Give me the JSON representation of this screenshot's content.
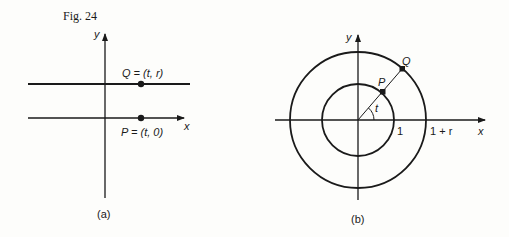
{
  "figure_label": "Fig. 24",
  "panel_a": {
    "caption": "(a)",
    "y_axis_label": "y",
    "x_axis_label": "x",
    "point_q_label": "Q = (t, r)",
    "point_p_label": "P = (t, 0)"
  },
  "panel_b": {
    "caption": "(b)",
    "y_axis_label": "y",
    "x_axis_label": "x",
    "point_q_label": "Q",
    "point_p_label": "P",
    "angle_label": "t",
    "inner_radius_label": "1",
    "outer_radius_label": "1 + r"
  },
  "colors": {
    "ink": "#1a1a1a",
    "paper": "#fdfdfb"
  }
}
